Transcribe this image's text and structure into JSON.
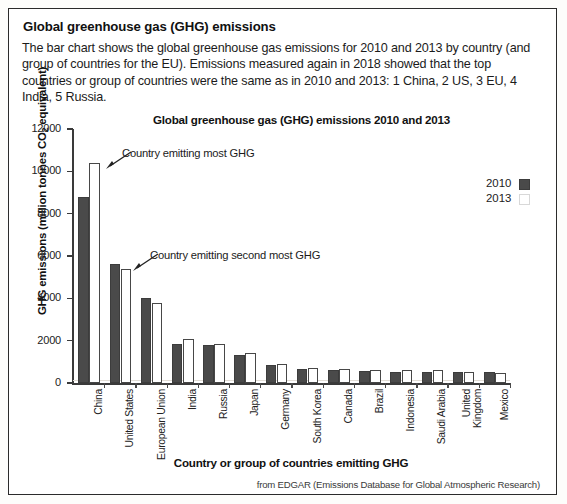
{
  "header": {
    "title": "Global greenhouse gas (GHG) emissions",
    "body": "The bar chart shows the global greenhouse gas emissions for 2010 and 2013 by country (and group of countries for the EU). Emissions measured again in 2018 showed that the top countries or group of countries were the same as in 2010 and 2013: 1 China, 2 US, 3 EU, 4 India, 5 Russia."
  },
  "annotations": [
    {
      "text": "Country emitting most GHG"
    },
    {
      "text": "Country emitting second most GHG"
    }
  ],
  "legend": {
    "position": "top-right",
    "entries": [
      {
        "label": "2010",
        "swatch": "dark"
      },
      {
        "label": "2013",
        "swatch": "light"
      }
    ]
  },
  "source": "from EDGAR (Emissions Database for Global Atmospheric Research)",
  "colors": {
    "series_2010": "#4a4a4a",
    "series_2013": "#ffffff",
    "axis": "#3a3a3a",
    "frame": "#2b2b2b"
  },
  "chart_data": {
    "type": "bar",
    "title": "Global greenhouse gas (GHG) emissions 2010 and 2013",
    "xlabel": "Country or group of countries emitting GHG",
    "ylabel": "GHG emissions (million tonnes CO2 equivalent)",
    "ylabel_parts": {
      "pre": "GHG emissions (million tonnes CO",
      "sub": "2",
      "post": " equivalent)"
    },
    "categories": [
      "China",
      "United States",
      "European Union",
      "India",
      "Russia",
      "Japan",
      "Germany",
      "South Korea",
      "Canada",
      "Brazil",
      "Indonesia",
      "Saudi Arabia",
      "United Kingdom",
      "Mexico"
    ],
    "series": [
      {
        "name": "2010",
        "values": [
          8800,
          5600,
          4000,
          1850,
          1800,
          1300,
          850,
          650,
          600,
          550,
          520,
          500,
          530,
          500
        ]
      },
      {
        "name": "2013",
        "values": [
          10400,
          5400,
          3800,
          2100,
          1850,
          1400,
          880,
          700,
          650,
          620,
          600,
          620,
          500,
          470
        ]
      }
    ],
    "ylim": [
      0,
      12000
    ],
    "yticks": [
      0,
      2000,
      4000,
      6000,
      8000,
      10000,
      12000
    ],
    "ytick_labels": [
      "0",
      "2000",
      "4000",
      "6000",
      "8000",
      "10000",
      "12000"
    ],
    "grid": "faint-horizontal-500",
    "legend_position": "top-right"
  }
}
